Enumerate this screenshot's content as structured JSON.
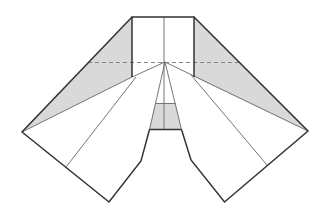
{
  "diagram": {
    "type": "origami-fold-diagram",
    "colors": {
      "background": "#ffffff",
      "fill_shaded": "#d9d9d9",
      "stroke_outline": "#333333",
      "stroke_thin": "#666666",
      "stroke_dashed": "#777777"
    },
    "shaded_regions": [
      {
        "name": "left-flap",
        "points": "132,17 132,77 22,132"
      },
      {
        "name": "right-flap",
        "points": "194,17 194,77 308,131"
      },
      {
        "name": "center-trapezoid",
        "points": "155,103.5 175.5,103.5 181.5,129.5 149.5,129.5"
      }
    ],
    "outline_paths": [
      {
        "name": "top-square-edges",
        "d": "M132,77 L132,17 L194,17 L194,77"
      },
      {
        "name": "left-wing-outline",
        "d": "M132,17 L22,132 L109,202 L141,161 L149.5,129.5"
      },
      {
        "name": "right-wing-outline",
        "d": "M194,17 L308,131 L224.5,202 L191,160 L181.5,129.5"
      },
      {
        "name": "trapezoid-bottom",
        "d": "M149.5,129.5 L181.5,129.5"
      }
    ],
    "thin_lines": [
      {
        "name": "center-vertical-crease",
        "d": "M164,17 L164,62 L164,129.5"
      },
      {
        "name": "left-boundary-crease",
        "d": "M165,62 L132,77 L22,132"
      },
      {
        "name": "right-boundary-crease",
        "d": "M165,62 L194,76 L308,131"
      },
      {
        "name": "left-fan-crease",
        "d": "M136,77 L66,167"
      },
      {
        "name": "right-fan-crease",
        "d": "M191,75 L267,165"
      },
      {
        "name": "left-center-crease",
        "d": "M165,62 L149.5,129.5"
      },
      {
        "name": "right-center-crease",
        "d": "M165,62 L181.5,129.5"
      },
      {
        "name": "trapezoid-top",
        "d": "M155,103.5 L175.5,103.5"
      }
    ],
    "dashed_lines": [
      {
        "name": "horizontal-fold-line",
        "d": "M88,62.5 L239,62.5"
      }
    ]
  }
}
